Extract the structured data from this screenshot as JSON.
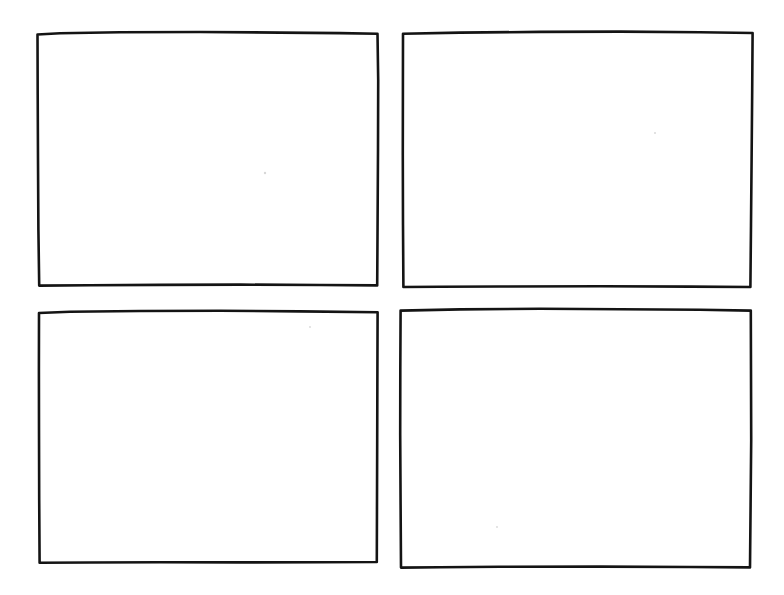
{
  "document": {
    "title": "Blank storyboard sheet",
    "kind": "hand-drawn-wireframe",
    "background_color": "#ffffff",
    "ink_color": "#141414",
    "stroke_width_px": 2.6,
    "page_width_px": 784,
    "page_height_px": 595,
    "grid": {
      "rows": 2,
      "columns": 2,
      "panel_count": 4
    }
  },
  "panels": [
    {
      "id": "panel-1",
      "label": "",
      "position": "top-left",
      "row": 1,
      "column": 1,
      "content": "",
      "bounds": {
        "x": 37,
        "y": 32,
        "width": 341,
        "height": 253
      },
      "outline_path": "M37.5,34.5 L60,33.2 L120,32.3 L200,32.0 L280,32.6 L340,33.1 L377.5,33.8 L378.2,80 L378.0,150 L377.6,220 L377.2,285.4 L320,285.0 L240,284.6 L160,284.9 L90,285.3 L39.2,285.6 L38.4,230 L38.0,160 L37.7,95 Z"
    },
    {
      "id": "panel-2",
      "label": "",
      "position": "top-right",
      "row": 1,
      "column": 2,
      "content": "",
      "bounds": {
        "x": 402,
        "y": 32,
        "width": 351,
        "height": 255
      },
      "outline_path": "M403.0,33.8 L460,32.6 L540,31.9 L620,31.6 L700,32.2 L752.6,33.0 L752.2,90 L751.6,160 L751.0,225 L750.4,287.0 L690,286.6 L600,286.2 L500,286.5 L440,286.8 L403.4,287.0 L403.0,225 L402.8,155 L402.9,90 Z"
    },
    {
      "id": "panel-3",
      "label": "",
      "position": "bottom-left",
      "row": 2,
      "column": 1,
      "content": "",
      "bounds": {
        "x": 38,
        "y": 311,
        "width": 340,
        "height": 252
      },
      "outline_path": "M39.0,313.0 L70,311.8 L140,311.0 L220,310.8 L300,311.4 L377.6,312.2 L377.4,370 L377.2,440 L377.0,500 L376.8,562.0 L320,562.2 L240,562.4 L160,562.3 L90,562.5 L39.6,562.8 L39.2,500 L39.0,430 L38.9,370 Z"
    },
    {
      "id": "panel-4",
      "label": "",
      "position": "bottom-right",
      "row": 2,
      "column": 2,
      "content": "",
      "bounds": {
        "x": 400,
        "y": 309,
        "width": 351,
        "height": 259
      },
      "outline_path": "M400.6,310.6 L460,309.4 L540,308.8 L620,309.2 L700,309.8 L750.8,310.6 L751.0,370 L751.2,440 L750.6,505 L750.0,567.4 L690,567.0 L600,566.6 L500,566.8 L440,567.2 L401.0,567.6 L400.6,505 L400.2,435 L400.3,370 Z"
    }
  ],
  "marks": [
    {
      "id": "speck-1",
      "x": 265,
      "y": 173,
      "r": 1.2,
      "color": "#d8d8d8"
    },
    {
      "id": "speck-2",
      "x": 655,
      "y": 133,
      "r": 1.0,
      "color": "#dedede"
    },
    {
      "id": "speck-3",
      "x": 310,
      "y": 327,
      "r": 0.9,
      "color": "#e2e2e2"
    },
    {
      "id": "speck-4",
      "x": 497,
      "y": 527,
      "r": 0.9,
      "color": "#e2e2e2"
    }
  ]
}
